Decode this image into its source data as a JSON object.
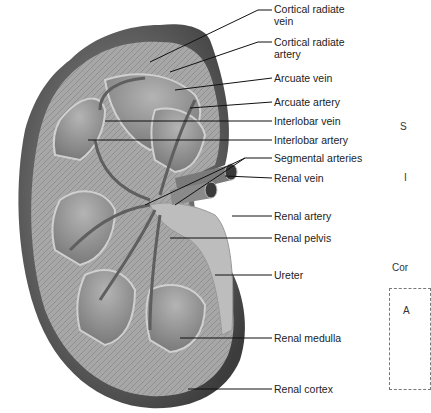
{
  "figure": {
    "labels": [
      {
        "text": "Cortical radiate",
        "text2": "vein"
      },
      {
        "text": "Cortical radiate",
        "text2": "artery"
      },
      {
        "text": "Arcuate vein"
      },
      {
        "text": "Arcuate artery"
      },
      {
        "text": "Interlobar vein"
      },
      {
        "text": "Interlobar artery"
      },
      {
        "text": "Segmental arteries"
      },
      {
        "text": "Renal vein"
      },
      {
        "text": "Renal artery"
      },
      {
        "text": "Renal pelvis"
      },
      {
        "text": "Ureter"
      },
      {
        "text": "Renal medulla"
      },
      {
        "text": "Renal cortex"
      }
    ],
    "clipped_side_labels": [
      "S",
      "I",
      "Cor",
      "A"
    ]
  },
  "colors": {
    "capsule": "#5a5a5a",
    "cortex": "#a9a9a9",
    "medulla": "#8e8e8e",
    "vessel": "#6b6b6b",
    "pelvis": "#bdbdbd",
    "leader": "#111111"
  }
}
